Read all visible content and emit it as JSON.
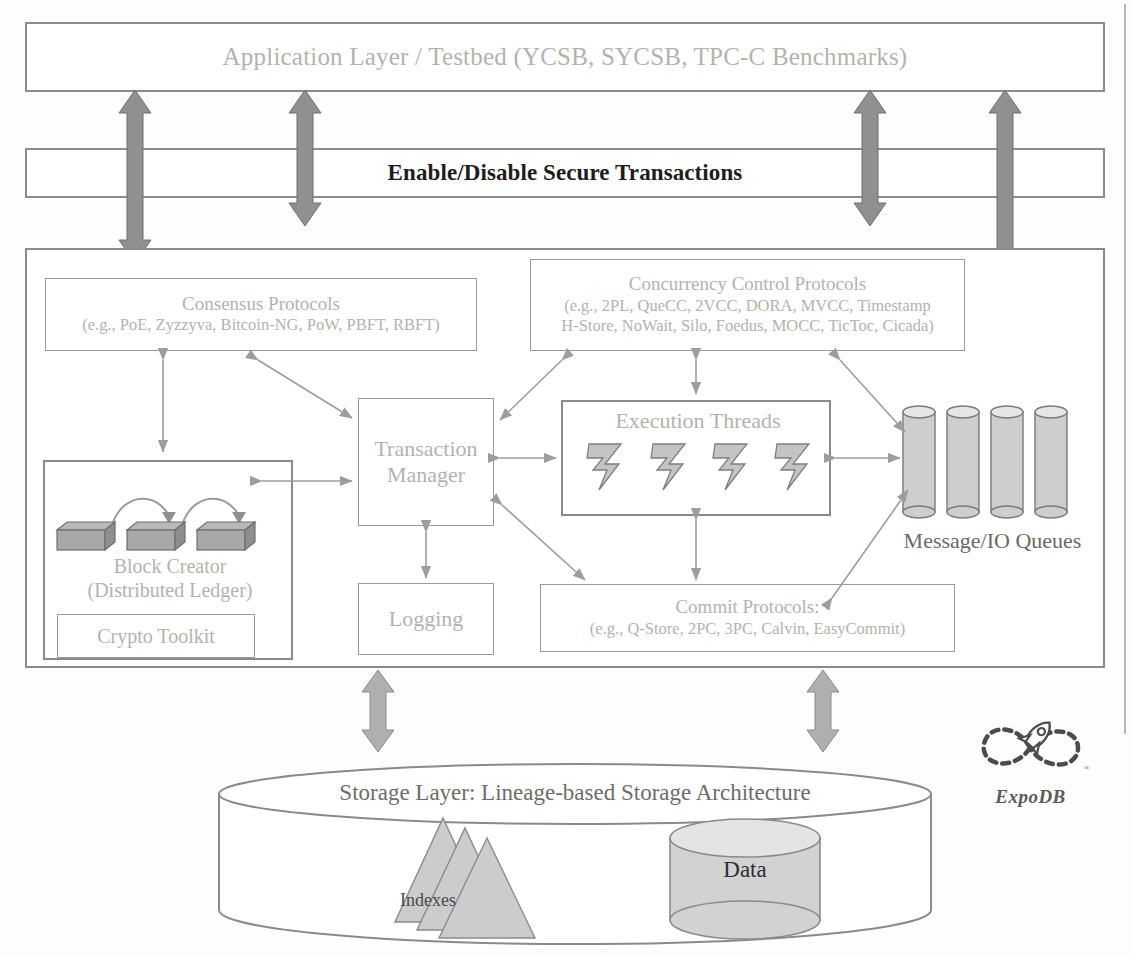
{
  "diagram": {
    "title_semantics": "ExpoDB layered system architecture",
    "colors": {
      "block_arrow_fill": "#909090",
      "block_arrow_stroke": "#6f6f6f",
      "shape_fill": "#c8c8c8",
      "box_stroke": "#8c8c8c",
      "gray_text": "#b3b3ad",
      "dark_text": "#1d1d1d"
    }
  },
  "application_layer": {
    "label": "Application Layer / Testbed (YCSB, SYCSB, TPC-C Benchmarks)"
  },
  "secure_band": {
    "label": "Enable/Disable Secure Transactions"
  },
  "main_layer": {
    "consensus": {
      "title": "Consensus Protocols",
      "examples": "(e.g., PoE, Zyzzyva, Bitcoin-NG, PoW, PBFT, RBFT)"
    },
    "concurrency": {
      "title": "Concurrency Control Protocols",
      "examples_line1": "(e.g., 2PL, QueCC, 2VCC, DORA, MVCC, Timestamp",
      "examples_line2": "H-Store, NoWait, Silo, Foedus, MOCC, TicToc, Cicada)"
    },
    "block_creator": {
      "title_line1": "Block Creator",
      "title_line2": "(Distributed Ledger)",
      "crypto_toolkit": "Crypto Toolkit",
      "block_count": 3
    },
    "transaction_manager": {
      "line1": "Transaction",
      "line2": "Manager"
    },
    "logging": {
      "label": "Logging"
    },
    "execution_threads": {
      "label": "Execution Threads",
      "thread_count": 4
    },
    "commit": {
      "title": "Commit Protocols:",
      "examples": "(e.g., Q-Store, 2PC, 3PC, Calvin, EasyCommit)"
    },
    "queues": {
      "label": "Message/IO Queues",
      "queue_count": 4
    }
  },
  "storage_layer": {
    "label": "Storage Layer: Lineage-based Storage Architecture",
    "indexes_label": "Indexes",
    "data_label": "Data",
    "index_count": 3
  },
  "logo": {
    "name": "ExpoDB",
    "wordmark": "ExpoDB",
    "registered_mark": "®",
    "icon": "infinity-rocket-logo"
  }
}
